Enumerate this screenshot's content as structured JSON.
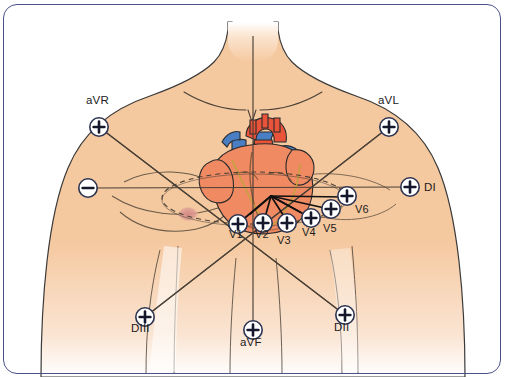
{
  "figure": {
    "border_color": "#4b4f8a",
    "skin_color": "#f5c9a0",
    "skin_outline": "#3a3a3a",
    "heart_red": "#e8533a",
    "heart_blue": "#4a7ec2",
    "electrode_fill": "#ffffff",
    "electrode_stroke": "#2b3350",
    "ray_color": "#111111",
    "axis_color": "#4a4036"
  },
  "electrodes": [
    {
      "id": "aVR",
      "label": "aVR",
      "polarity": "+",
      "cx": 99,
      "cy": 127,
      "lx": 86,
      "ly": 100
    },
    {
      "id": "aVL",
      "label": "aVL",
      "polarity": "+",
      "cx": 389,
      "cy": 127,
      "lx": 378,
      "ly": 100
    },
    {
      "id": "neg",
      "label": "",
      "polarity": "-",
      "cx": 88,
      "cy": 188,
      "lx": 0,
      "ly": 0
    },
    {
      "id": "DI",
      "label": "DI",
      "polarity": "+",
      "cx": 410,
      "cy": 187,
      "lx": 424,
      "ly": 181
    },
    {
      "id": "DIII",
      "label": "DIII",
      "polarity": "+",
      "cx": 145,
      "cy": 317,
      "lx": 132,
      "ly": 325
    },
    {
      "id": "aVF",
      "label": "aVF",
      "polarity": "+",
      "cx": 253,
      "cy": 330,
      "lx": 240,
      "ly": 339
    },
    {
      "id": "DII",
      "label": "DII",
      "polarity": "+",
      "cx": 345,
      "cy": 315,
      "lx": 334,
      "ly": 324
    },
    {
      "id": "V1",
      "label": "V1",
      "polarity": "+",
      "cx": 238,
      "cy": 224,
      "lx": 230,
      "ly": 231
    },
    {
      "id": "V2",
      "label": "V2",
      "polarity": "+",
      "cx": 263,
      "cy": 223,
      "lx": 256,
      "ly": 231
    },
    {
      "id": "V3",
      "label": "V3",
      "polarity": "+",
      "cx": 287,
      "cy": 223,
      "lx": 279,
      "ly": 236
    },
    {
      "id": "V4",
      "label": "V4",
      "polarity": "+",
      "cx": 311,
      "cy": 218,
      "lx": 304,
      "ly": 228
    },
    {
      "id": "V5",
      "label": "V5",
      "polarity": "+",
      "cx": 331,
      "cy": 209,
      "lx": 325,
      "ly": 224
    },
    {
      "id": "V6",
      "label": "V6",
      "polarity": "+",
      "cx": 347,
      "cy": 196,
      "lx": 356,
      "ly": 207
    }
  ],
  "heart": {
    "center_x": 271,
    "center_y": 196,
    "caption": "heart with great vessels"
  },
  "labels": {
    "aVR": "aVR",
    "aVL": "aVL",
    "DI": "DI",
    "DII": "DII",
    "DIII": "DIII",
    "aVF": "aVF",
    "V1": "V1",
    "V2": "V2",
    "V3": "V3",
    "V4": "V4",
    "V5": "V5",
    "V6": "V6"
  }
}
